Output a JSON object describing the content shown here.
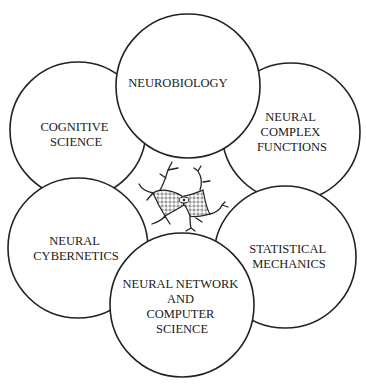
{
  "diagram": {
    "center": {
      "label": "neuron",
      "icon": "neuron-cell-drawing"
    },
    "nodes": [
      {
        "id": "cognitive-science",
        "lines": [
          "COGNITIVE",
          "SCIENCE"
        ],
        "cx": 78,
        "cy": 130,
        "r": 68
      },
      {
        "id": "neural-cybernetics",
        "lines": [
          "NEURAL",
          "CYBERNETICS"
        ],
        "cx": 78,
        "cy": 248,
        "r": 70
      },
      {
        "id": "statistical-mechanics",
        "lines": [
          "STATISTICAL",
          "MECHANICS"
        ],
        "cx": 285,
        "cy": 257,
        "r": 71
      },
      {
        "id": "neural-complex-functions",
        "lines": [
          "NEURAL",
          "COMPLEX",
          "FUNCTIONS"
        ],
        "cx": 291,
        "cy": 132,
        "r": 69
      },
      {
        "id": "neural-network-computer-science",
        "lines": [
          "NEURAL NETWORK",
          "AND",
          "COMPUTER",
          "SCIENCE"
        ],
        "cx": 182,
        "cy": 305,
        "r": 72
      },
      {
        "id": "neurobiology",
        "lines": [
          "NEUROBIOLOGY"
        ],
        "cx": 188,
        "cy": 86,
        "r": 72
      }
    ],
    "colors": {
      "stroke": "#222222",
      "background": "#ffffff",
      "text": "#1a1a1a"
    }
  }
}
